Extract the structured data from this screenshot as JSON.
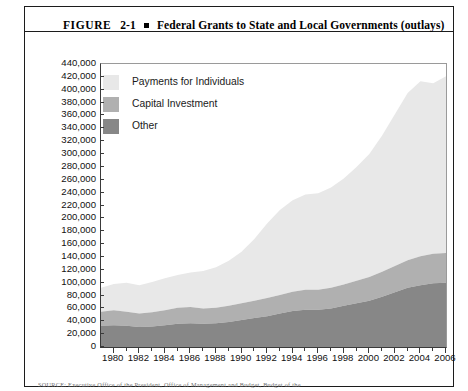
{
  "figure": {
    "label": "FIGURE",
    "number": "2-1",
    "title": "Federal Grants to State and Local Governments (outlays)",
    "source_note": "SOURCE: Executive Office of the President, Office of Management and Budget, Budget of the"
  },
  "colors": {
    "payments_for_individuals": "#e8e8e8",
    "capital_investment": "#b0b0b0",
    "other": "#878787",
    "axis": "#3a3a3a",
    "border": "#1c1c1c"
  },
  "chart_data": {
    "type": "area",
    "stacked": true,
    "title": "Federal Grants to State and Local Governments (outlays)",
    "xlabel": "",
    "ylabel": "",
    "grid": false,
    "legend_position": "inside-top-left",
    "ylim": [
      0,
      440000
    ],
    "ytick_step": 20000,
    "ytick_labels": [
      "440,000",
      "420,000",
      "400,000",
      "380,000",
      "360,000",
      "340,000",
      "320,000",
      "300,000",
      "280,000",
      "260,000",
      "240,000",
      "220,000",
      "200,000",
      "180,000",
      "160,000",
      "140,000",
      "120,000",
      "100,000",
      "80,000",
      "60,000",
      "40,000",
      "20,000",
      "0"
    ],
    "xlim": [
      1979,
      2006
    ],
    "xtick_labels": [
      "1980",
      "1982",
      "1984",
      "1986",
      "1988",
      "1990",
      "1992",
      "1994",
      "1996",
      "1998",
      "2000",
      "2002",
      "2004",
      "2006"
    ],
    "x": [
      1979,
      1980,
      1981,
      1982,
      1983,
      1984,
      1985,
      1986,
      1987,
      1988,
      1989,
      1990,
      1991,
      1992,
      1993,
      1994,
      1995,
      1996,
      1997,
      1998,
      1999,
      2000,
      2001,
      2002,
      2003,
      2004,
      2005,
      2006
    ],
    "series": [
      {
        "name": "Other",
        "color": "#878787",
        "values": [
          33000,
          34000,
          33000,
          31000,
          32000,
          34000,
          36000,
          37000,
          36000,
          37000,
          39000,
          42000,
          45000,
          48000,
          52000,
          56000,
          58000,
          58000,
          60000,
          64000,
          68000,
          72000,
          78000,
          85000,
          92000,
          96000,
          99000,
          100000
        ]
      },
      {
        "name": "Capital Investment",
        "color": "#b0b0b0",
        "values": [
          22000,
          23000,
          22000,
          21000,
          22000,
          23000,
          25000,
          25000,
          24000,
          24000,
          25000,
          26000,
          27000,
          28000,
          29000,
          30000,
          31000,
          31000,
          32000,
          33000,
          35000,
          37000,
          39000,
          41000,
          43000,
          45000,
          46000,
          46000
        ]
      },
      {
        "name": "Payments for Individuals",
        "color": "#e8e8e8",
        "values": [
          37000,
          41000,
          45000,
          44000,
          47000,
          50000,
          51000,
          54000,
          58000,
          63000,
          70000,
          80000,
          96000,
          116000,
          132000,
          142000,
          148000,
          150000,
          156000,
          165000,
          177000,
          191000,
          212000,
          236000,
          260000,
          272000,
          265000,
          275000
        ]
      }
    ],
    "legend": [
      "Payments for Individuals",
      "Capital Investment",
      "Other"
    ]
  }
}
